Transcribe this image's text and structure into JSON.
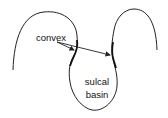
{
  "diagram": {
    "labels": {
      "convex": "convex",
      "sulcal": "sulcal",
      "basin": "basin"
    },
    "colors": {
      "stroke": "#222222",
      "background": "#ffffff"
    }
  }
}
